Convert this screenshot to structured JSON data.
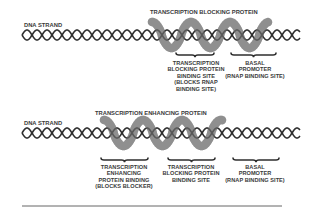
{
  "panels": [
    {
      "id": "blocking",
      "strand_label": "DNA STRAND",
      "protein_label": "TRANSCRIPTION BLOCKING PROTEIN",
      "sites": [
        {
          "lines": [
            "TRANSCRIPTION",
            "BLOCKING PROTEIN",
            "BINDING SITE",
            "(BLOCKS RNAP",
            "BINDING SITE)"
          ]
        },
        {
          "lines": [
            "BASAL",
            "PROMOTER",
            "(RNAP BINDING SITE)"
          ]
        }
      ]
    },
    {
      "id": "enhancing",
      "strand_label": "DNA STRAND",
      "protein_label": "TRANSCRIPTION ENHANCING PROTEIN",
      "sites": [
        {
          "lines": [
            "TRANSCRIPTION",
            "ENHANCING",
            "PROTEIN BINDING",
            "(BLOCKS BLOCKER)"
          ]
        },
        {
          "lines": [
            "TRANSCRIPTION",
            "BLOCKING PROTEIN",
            "BINDING SITE"
          ]
        },
        {
          "lines": [
            "BASAL",
            "PROMOTER",
            "(RNAP BINDING SITE)"
          ]
        }
      ]
    }
  ],
  "colors": {
    "dna": "#2e2e2e",
    "protein": "#8c8c8c",
    "text": "#3a3a3a",
    "divider": "#555555"
  }
}
